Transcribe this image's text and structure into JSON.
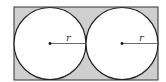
{
  "diagram": {
    "rectangle": {
      "x": 14,
      "y": 7,
      "width": 144,
      "height": 73,
      "fill": "#cfcfcf",
      "stroke": "#333333"
    },
    "circles": [
      {
        "cx": 50,
        "cy": 43.5,
        "r": 36,
        "fill": "#ffffff",
        "radius_label": "r"
      },
      {
        "cx": 122,
        "cy": 43.5,
        "r": 36,
        "fill": "#ffffff",
        "radius_label": "r"
      }
    ]
  }
}
